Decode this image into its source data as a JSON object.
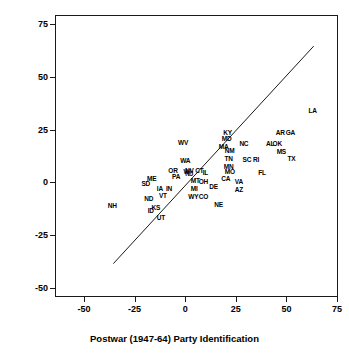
{
  "chart_data": {
    "type": "scatter",
    "title": "",
    "xlabel": "Postwar (1947-64) Party Identification",
    "ylabel": "Contemporary (1976-88) Party Identification",
    "xlim": [
      -50,
      75
    ],
    "ylim": [
      -50,
      75
    ],
    "xticks": [
      "-50",
      "-25",
      "0",
      "25",
      "50",
      "75"
    ],
    "xtick_values": [
      -50,
      -25,
      0,
      25,
      50,
      75
    ],
    "yticks": [
      "75",
      "50",
      "25",
      "0",
      "-25",
      "-50"
    ],
    "ytick_values": [
      75,
      50,
      25,
      0,
      -25,
      -50
    ],
    "grid": false,
    "legend": "none",
    "marker_style": "text-labels",
    "reference_line": {
      "label": "45-degree equality line",
      "type": "line",
      "x": [
        -36,
        63
      ],
      "y": [
        -38,
        65
      ]
    },
    "point_labels": [
      "NH",
      "SD",
      "ME",
      "ND",
      "KS",
      "ID",
      "UT",
      "IA",
      "VT",
      "IN",
      "OR",
      "PA",
      "WA",
      "WI",
      "NV",
      "NJ",
      "CT",
      "IL",
      "MT",
      "OH",
      "MI",
      "WY",
      "CO",
      "DE",
      "NE",
      "WV",
      "KY",
      "MD",
      "MA",
      "NM",
      "TN",
      "MN",
      "MO",
      "CA",
      "VA",
      "AZ",
      "NC",
      "SC",
      "RI",
      "FL",
      "AL",
      "OK",
      "AR",
      "GA",
      "MS",
      "TX",
      "LA"
    ],
    "points": [
      {
        "label": "NH",
        "x": -36.5,
        "y": -10.5
      },
      {
        "label": "SD",
        "x": -20.0,
        "y": -0.5
      },
      {
        "label": "ME",
        "x": -17.0,
        "y": 2.0
      },
      {
        "label": "ND",
        "x": -18.5,
        "y": -7.5
      },
      {
        "label": "KS",
        "x": -15.0,
        "y": -11.5
      },
      {
        "label": "ID",
        "x": -17.5,
        "y": -13.0
      },
      {
        "label": "UT",
        "x": -12.5,
        "y": -16.5
      },
      {
        "label": "IA",
        "x": -13.0,
        "y": -2.5
      },
      {
        "label": "VT",
        "x": -11.5,
        "y": -6.0
      },
      {
        "label": "IN",
        "x": -8.5,
        "y": -2.5
      },
      {
        "label": "OR",
        "x": -6.5,
        "y": 6.0
      },
      {
        "label": "PA",
        "x": -5.0,
        "y": 3.0
      },
      {
        "label": "WA",
        "x": -0.5,
        "y": 10.5
      },
      {
        "label": "WI",
        "x": 0.5,
        "y": 5.5
      },
      {
        "label": "NV",
        "x": 1.5,
        "y": 6.0
      },
      {
        "label": "NJ",
        "x": 1.5,
        "y": 4.5
      },
      {
        "label": "CT",
        "x": 6.5,
        "y": 6.0
      },
      {
        "label": "IL",
        "x": 9.5,
        "y": 5.0
      },
      {
        "label": "MT",
        "x": 4.5,
        "y": 1.0
      },
      {
        "label": "OH",
        "x": 8.5,
        "y": 0.5
      },
      {
        "label": "MI",
        "x": 4.0,
        "y": -2.5
      },
      {
        "label": "WY",
        "x": 3.5,
        "y": -6.5
      },
      {
        "label": "CO",
        "x": 8.5,
        "y": -6.5
      },
      {
        "label": "DE",
        "x": 13.5,
        "y": -1.5
      },
      {
        "label": "NE",
        "x": 16.0,
        "y": -10.0
      },
      {
        "label": "WV",
        "x": -1.5,
        "y": 19.0
      },
      {
        "label": "KY",
        "x": 20.5,
        "y": 24.0
      },
      {
        "label": "MD",
        "x": 20.0,
        "y": 21.0
      },
      {
        "label": "MA",
        "x": 18.5,
        "y": 17.0
      },
      {
        "label": "NM",
        "x": 21.5,
        "y": 15.5
      },
      {
        "label": "TN",
        "x": 21.0,
        "y": 11.5
      },
      {
        "label": "MN",
        "x": 21.0,
        "y": 8.0
      },
      {
        "label": "MO",
        "x": 21.5,
        "y": 5.5
      },
      {
        "label": "CA",
        "x": 19.5,
        "y": 2.0
      },
      {
        "label": "VA",
        "x": 26.0,
        "y": 0.5
      },
      {
        "label": "AZ",
        "x": 26.0,
        "y": -3.0
      },
      {
        "label": "NC",
        "x": 28.5,
        "y": 18.5
      },
      {
        "label": "SC",
        "x": 30.0,
        "y": 11.0
      },
      {
        "label": "RI",
        "x": 34.5,
        "y": 11.0
      },
      {
        "label": "FL",
        "x": 37.5,
        "y": 5.0
      },
      {
        "label": "AL",
        "x": 41.5,
        "y": 18.5
      },
      {
        "label": "OK",
        "x": 45.0,
        "y": 18.5
      },
      {
        "label": "AR",
        "x": 46.5,
        "y": 24.0
      },
      {
        "label": "GA",
        "x": 51.5,
        "y": 24.0
      },
      {
        "label": "MS",
        "x": 47.0,
        "y": 15.0
      },
      {
        "label": "TX",
        "x": 52.0,
        "y": 11.5
      },
      {
        "label": "LA",
        "x": 62.5,
        "y": 34.5
      }
    ]
  }
}
